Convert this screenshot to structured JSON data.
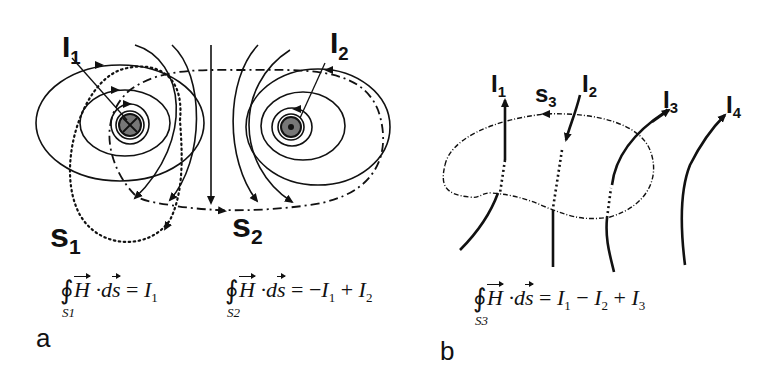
{
  "panels": {
    "a": {
      "letter": "a",
      "labels": {
        "I1": {
          "main": "I",
          "sub": "1"
        },
        "I2": {
          "main": "I",
          "sub": "2"
        },
        "s1": {
          "main": "s",
          "sub": "1"
        },
        "s2": {
          "main": "s",
          "sub": "2"
        }
      },
      "conductors": [
        {
          "name": "I1",
          "direction": "into-page",
          "symbol": "⊗"
        },
        {
          "name": "I2",
          "direction": "out-of-page",
          "symbol": "⊙"
        }
      ],
      "equations": [
        {
          "contour": "S1",
          "lhs_H": "H",
          "lhs_dot": "·",
          "lhs_d": "d",
          "lhs_s": "s",
          "equals": "=",
          "rhs": [
            {
              "sign": "",
              "sym": "I",
              "sub": "1"
            }
          ]
        },
        {
          "contour": "S2",
          "lhs_H": "H",
          "lhs_dot": "·",
          "lhs_d": "d",
          "lhs_s": "s",
          "equals": "=",
          "rhs": [
            {
              "sign": "−",
              "sym": "I",
              "sub": "1"
            },
            {
              "sign": "+",
              "sym": "I",
              "sub": "2"
            }
          ]
        }
      ]
    },
    "b": {
      "letter": "b",
      "labels": {
        "I1": {
          "main": "I",
          "sub": "1"
        },
        "I2": {
          "main": "I",
          "sub": "2"
        },
        "I3": {
          "main": "I",
          "sub": "3"
        },
        "I4": {
          "main": "I",
          "sub": "4"
        },
        "s3": {
          "main": "s",
          "sub": "3"
        }
      },
      "equations": [
        {
          "contour": "S3",
          "lhs_H": "H",
          "lhs_dot": "·",
          "lhs_d": "d",
          "lhs_s": "s",
          "equals": "=",
          "rhs": [
            {
              "sign": "",
              "sym": "I",
              "sub": "1"
            },
            {
              "sign": "−",
              "sym": "I",
              "sub": "2"
            },
            {
              "sign": "+",
              "sym": "I",
              "sub": "3"
            }
          ]
        }
      ]
    }
  },
  "colors": {
    "ink": "#111111",
    "conductor_fill": "#777777",
    "background": "#ffffff"
  },
  "integral_symbol": "∮"
}
